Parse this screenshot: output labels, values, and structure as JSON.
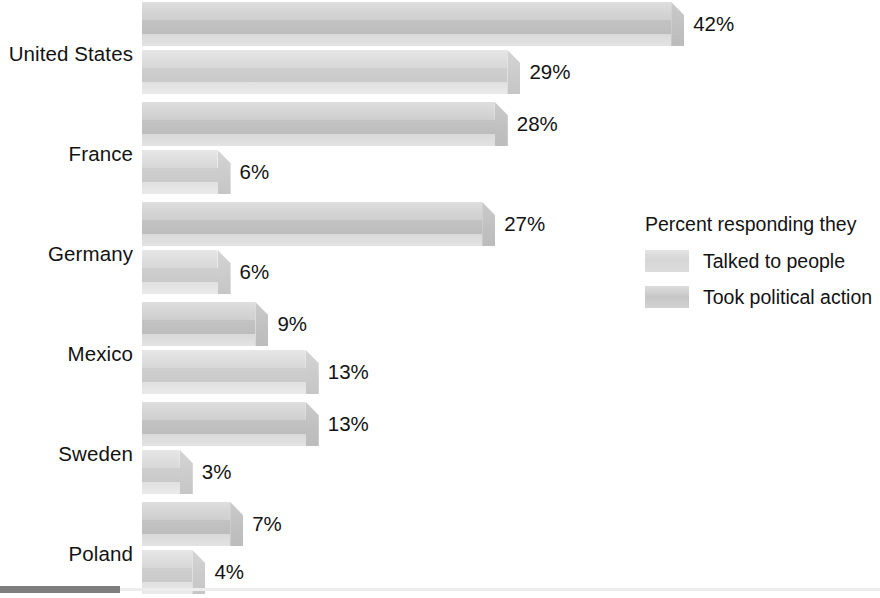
{
  "chart_data": {
    "type": "bar",
    "orientation": "horizontal",
    "title": "",
    "xlabel": "",
    "ylabel": "",
    "xlim": [
      0,
      45
    ],
    "grid": true,
    "legend_position": "right",
    "value_suffix": "%",
    "categories": [
      "United States",
      "France",
      "Germany",
      "Mexico",
      "Sweden",
      "Poland"
    ],
    "series": [
      {
        "name": "Talked to people",
        "values": [
          42,
          28,
          27,
          9,
          13,
          7
        ],
        "labels": [
          "42%",
          "28%",
          "27%",
          "9%",
          "13%",
          "7%"
        ]
      },
      {
        "name": "Took political action",
        "values": [
          29,
          6,
          6,
          13,
          3,
          4
        ],
        "labels": [
          "29%",
          "6%",
          "6%",
          "13%",
          "3%",
          "4%"
        ]
      }
    ]
  },
  "legend": {
    "title": "Percent responding they",
    "items": [
      {
        "label": "Talked to people",
        "swatch": "talked"
      },
      {
        "label": "Took political action",
        "swatch": "action"
      }
    ]
  },
  "colors": {
    "bar_talked": "#d7d7d7",
    "bar_action": "#c9c9c9",
    "text": "#131313",
    "background": "#ffffff",
    "footer_rule": "#7e7e7e"
  }
}
